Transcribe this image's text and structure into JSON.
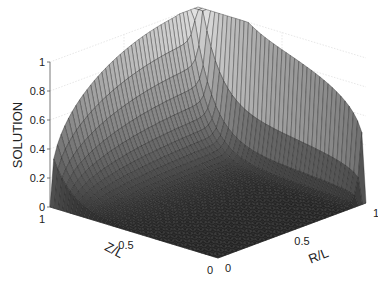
{
  "chart_data": {
    "type": "surface3d",
    "title": "",
    "zlabel": "SOLUTION",
    "xlabel": "R/L",
    "ylabel": "Z/L",
    "x_ticks": [
      "0",
      "0.5",
      "1"
    ],
    "y_ticks": [
      "0",
      "0.5",
      "1"
    ],
    "z_ticks": [
      "0",
      "0.2",
      "0.4",
      "0.6",
      "0.8",
      "1"
    ],
    "xlim": [
      0,
      1
    ],
    "ylim": [
      0,
      1
    ],
    "zlim": [
      0,
      1
    ],
    "grid": true,
    "colormap": "gray",
    "mesh_resolution": 40,
    "samples": {
      "R/L": [
        0,
        0.25,
        0.5,
        0.75,
        1
      ],
      "Z/L": [
        0,
        0.25,
        0.5,
        0.75,
        1
      ],
      "SOLUTION": [
        [
          0,
          0,
          0,
          0,
          0
        ],
        [
          0,
          0.02,
          0.04,
          0.06,
          1
        ],
        [
          0,
          0.06,
          0.12,
          0.18,
          1
        ],
        [
          0,
          0.15,
          0.3,
          0.45,
          1
        ],
        [
          0,
          1,
          1,
          1,
          1
        ]
      ]
    }
  },
  "labels": {
    "zlabel": "SOLUTION",
    "xlabel": "R/L",
    "ylabel": "Z/L"
  }
}
